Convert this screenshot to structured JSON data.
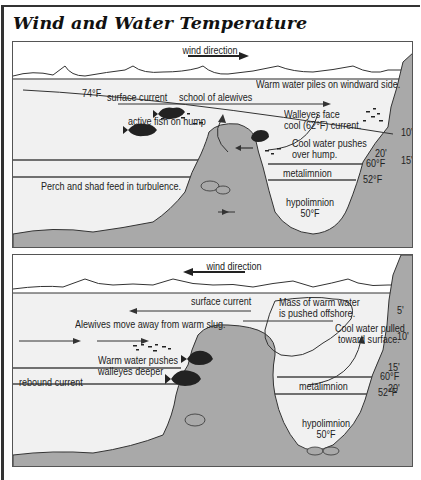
{
  "title": "Wind and Water Temperature",
  "colors": {
    "water": "#f1f1f1",
    "rock": "#a9a9a9",
    "line": "#333333",
    "text": "#222222"
  },
  "panel_top": {
    "wind_label": "wind direction",
    "wind_arrow": "right",
    "surface_temp": "74°F",
    "surface_current": "surface current",
    "school": "school of alewives",
    "warm_piles": "Warm water piles on windward side.",
    "active_fish": "active fish on hump",
    "walleyes_face_1": "Walleyes face",
    "walleyes_face_2": "cool (62°F) current.",
    "cool_pushes_1": "Cool water pushes",
    "cool_pushes_2": "over hump.",
    "perch": "Perch and shad feed in turbulence.",
    "metalimnion": "metalimnion",
    "hypolimnion": "hypolimnion",
    "hypo_temp": "50°F",
    "temp_60": "60°F",
    "temp_52": "52°F",
    "depths": [
      "10'",
      "15'",
      "20'"
    ]
  },
  "panel_bottom": {
    "wind_label": "wind direction",
    "wind_arrow": "left",
    "surface_current": "surface current",
    "mass_1": "Mass of warm water",
    "mass_2": "is pushed offshore.",
    "alewives": "Alewives move away from warm slug.",
    "cool_pulled_1": "Cool water pulled",
    "cool_pulled_2": "toward surface.",
    "warm_pushes_1": "Warm water pushes",
    "warm_pushes_2": "walleyes deeper",
    "rebound": "rebound current",
    "metalimnion": "metalimnion",
    "hypolimnion": "hypolimnion",
    "hypo_temp": "50°F",
    "temp_60": "60°F",
    "temp_52": "52°F",
    "depths": [
      "5'",
      "10'",
      "15'",
      "20'"
    ]
  }
}
